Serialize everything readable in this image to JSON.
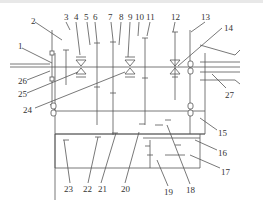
{
  "figure": {
    "type": "gearbox transmission schematic",
    "line_color": "#555555",
    "background": "#ffffff"
  },
  "labels": [
    {
      "id": "1",
      "text": "1",
      "x": 18,
      "y": 42
    },
    {
      "id": "2",
      "text": "2",
      "x": 31,
      "y": 17
    },
    {
      "id": "3",
      "text": "3",
      "x": 64,
      "y": 13
    },
    {
      "id": "4",
      "text": "4",
      "x": 74,
      "y": 13
    },
    {
      "id": "5",
      "text": "5",
      "x": 84,
      "y": 13
    },
    {
      "id": "6",
      "text": "6",
      "x": 93,
      "y": 13
    },
    {
      "id": "7",
      "text": "7",
      "x": 108,
      "y": 13
    },
    {
      "id": "8",
      "text": "8",
      "x": 119,
      "y": 13
    },
    {
      "id": "9",
      "text": "9",
      "x": 128,
      "y": 13
    },
    {
      "id": "10",
      "text": "10",
      "x": 135,
      "y": 13
    },
    {
      "id": "11",
      "text": "11",
      "x": 146,
      "y": 13
    },
    {
      "id": "12",
      "text": "12",
      "x": 171,
      "y": 13
    },
    {
      "id": "13",
      "text": "13",
      "x": 201,
      "y": 13
    },
    {
      "id": "14",
      "text": "14",
      "x": 224,
      "y": 24
    },
    {
      "id": "15",
      "text": "15",
      "x": 218,
      "y": 129
    },
    {
      "id": "16",
      "text": "16",
      "x": 218,
      "y": 149
    },
    {
      "id": "17",
      "text": "17",
      "x": 221,
      "y": 168
    },
    {
      "id": "18",
      "text": "18",
      "x": 186,
      "y": 186
    },
    {
      "id": "19",
      "text": "19",
      "x": 164,
      "y": 188
    },
    {
      "id": "20",
      "text": "20",
      "x": 121,
      "y": 185
    },
    {
      "id": "21",
      "text": "21",
      "x": 98,
      "y": 185
    },
    {
      "id": "22",
      "text": "22",
      "x": 83,
      "y": 185
    },
    {
      "id": "23",
      "text": "23",
      "x": 64,
      "y": 185
    },
    {
      "id": "24",
      "text": "24",
      "x": 23,
      "y": 106
    },
    {
      "id": "25",
      "text": "25",
      "x": 18,
      "y": 90
    },
    {
      "id": "26",
      "text": "26",
      "x": 18,
      "y": 77
    },
    {
      "id": "27",
      "text": "27",
      "x": 225,
      "y": 91
    }
  ]
}
